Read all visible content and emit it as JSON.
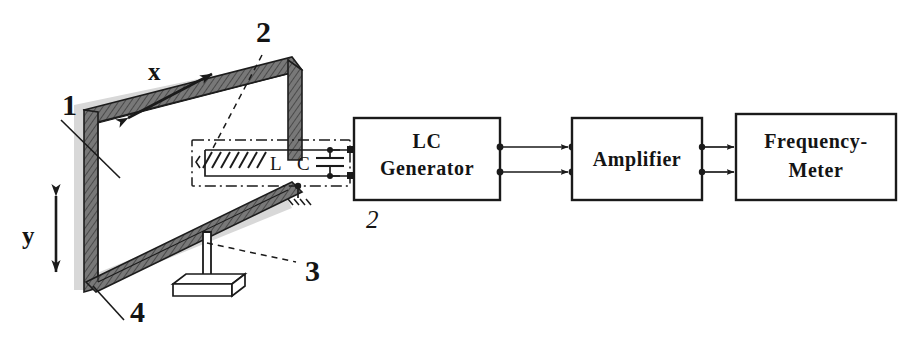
{
  "figure": {
    "background_color": "#ffffff",
    "ink_color": "#1a1a1a",
    "rail_color": "#6f6f6f",
    "shadow_color": "#d8d8d8"
  },
  "axes": {
    "x_label": "x",
    "y_label": "y"
  },
  "callouts": {
    "one": "1",
    "two": "2",
    "three": "3",
    "four": "4",
    "generator_index": "2"
  },
  "tank_circuit": {
    "inductor_label": "L",
    "capacitor_label": "C",
    "ground_name": "ground-symbol",
    "enclosure_style": "dash-dot"
  },
  "blocks": [
    {
      "id": "lc-generator",
      "lines": [
        "LC",
        "Generator"
      ]
    },
    {
      "id": "amplifier",
      "lines": [
        "Amplifier"
      ]
    },
    {
      "id": "frequency-meter",
      "lines": [
        "Frequency-",
        "Meter"
      ]
    }
  ],
  "stand": {
    "name": "support-stand",
    "parts": [
      "post",
      "base-plate"
    ]
  }
}
